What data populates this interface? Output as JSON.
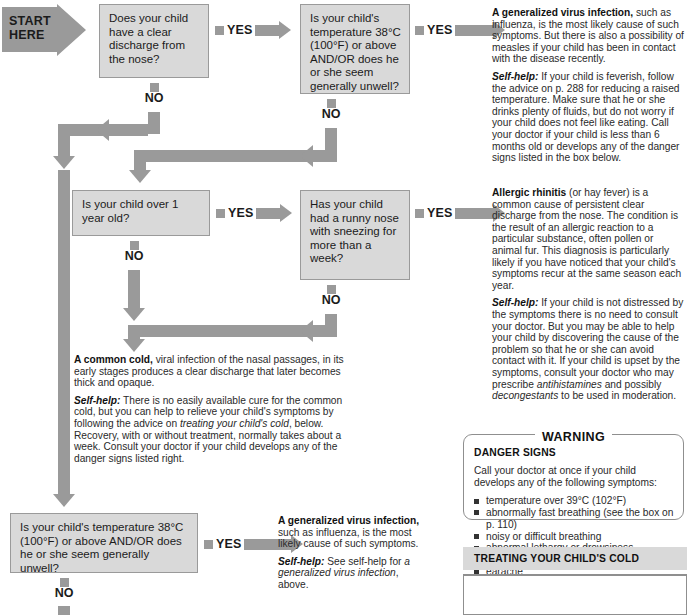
{
  "start": {
    "line1": "START",
    "line2": "HERE"
  },
  "labels": {
    "yes": "YES",
    "no": "NO"
  },
  "questions": [
    {
      "id": "q1",
      "text": "Does your child have a clear discharge from the nose?"
    },
    {
      "id": "q2",
      "text": "Is your child's temperature 38°C (100°F) or above AND/OR does he or she seem generally unwell?"
    },
    {
      "id": "q3",
      "text": "Is your child over 1 year old?"
    },
    {
      "id": "q4",
      "text": "Has your child had a runny nose with sneezing for more than a week?"
    },
    {
      "id": "q5",
      "text": "Is your child's temperature 38°C (100°F) or above AND/OR does he or she seem generally unwell?"
    }
  ],
  "outcomes": {
    "virus": {
      "lead": "A generalized virus infection,",
      "body": " such as influenza, is the most likely cause of such symptoms. But there is also a possibility of measles if your child has been in contact with the disease recently.",
      "selfhelp_label": "Self-help:",
      "selfhelp_body": " If your child is feverish, follow the advice on p. 288 for reducing a raised temperature. Make sure that he or she drinks plenty of fluids, but do not worry if your child does not feel like eating. Call your doctor if your child is less than 6 months old or develops any of the danger signs listed in the box below."
    },
    "rhinitis": {
      "lead": "Allergic rhinitis",
      "body": " (or hay fever) is a common cause of persistent clear discharge from the nose. The condition is the result of an allergic reaction to a particular substance, often pollen or animal fur. This diagnosis is particularly likely if you have noticed that your child's symptoms recur at the same season each year.",
      "selfhelp_label": "Self-help:",
      "selfhelp_body_1": " If your child is not distressed by the symptoms there is no need to consult your doctor. But you may be able to help your child by discovering the cause of the problem so that he or she can avoid contact with it. If your child is upset by the symptoms, consult your doctor who may prescribe ",
      "selfhelp_em_1": "antihistamines",
      "selfhelp_body_2": " and possibly ",
      "selfhelp_em_2": "decongestants",
      "selfhelp_body_3": " to be used in moderation."
    },
    "cold": {
      "lead": "A common cold,",
      "body": " viral infection of the nasal passages, in its early stages produces a clear discharge that later becomes thick and opaque.",
      "selfhelp_label": "Self-help:",
      "selfhelp_body_1": " There is no easily available cure for the common cold, but you can help to relieve your child's symptoms by following the advice on ",
      "selfhelp_em_1": "treating your child's cold",
      "selfhelp_body_2": ", below. Recovery, with or without treatment, normally takes about a week. Consult your doctor if your child develops any of the danger signs listed right."
    },
    "virus2": {
      "lead": "A generalized virus infection,",
      "body": " such as influenza, is the most likely cause of such symptoms.",
      "selfhelp_label": "Self-help:",
      "selfhelp_body_1": " See self-help for ",
      "selfhelp_em_1": "a generalized virus infection",
      "selfhelp_body_2": ", above."
    }
  },
  "warning": {
    "title": "WARNING",
    "heading": "DANGER SIGNS",
    "intro": "Call your doctor at once if your child develops any of the following symptoms:",
    "items": [
      "temperature over 39°C (102°F)",
      "abnormally fast breathing (see the box on p. 110)",
      "noisy or difficult breathing",
      "abnormal lethargy or drowsiness",
      "rash",
      "earache"
    ]
  },
  "treating": {
    "title": "TREATING YOUR CHILD'S COLD"
  },
  "colors": {
    "box_fill": "#d9d9d9",
    "box_border": "#9a9a9a",
    "arrow": "#9a9a9a",
    "text": "#1b1b1b"
  }
}
